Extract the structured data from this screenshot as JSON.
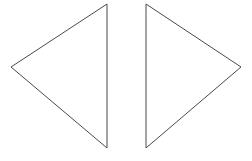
{
  "canvas": {
    "width": 252,
    "height": 161,
    "background_color": "#ffffff",
    "description": "Two outlined triangles facing each other"
  },
  "style": {
    "stroke_color": "#4a4a4a",
    "stroke_width": 1,
    "fill": "none"
  },
  "shapes": [
    {
      "name": "left-triangle",
      "type": "triangle",
      "orientation": "pointing-left",
      "points": "11,67 107,4 107,148",
      "vertices": [
        {
          "label": "apex-left",
          "x": 11,
          "y": 67
        },
        {
          "label": "top-right",
          "x": 107,
          "y": 4
        },
        {
          "label": "bottom-right",
          "x": 107,
          "y": 148
        }
      ]
    },
    {
      "name": "right-triangle",
      "type": "triangle",
      "orientation": "pointing-right",
      "points": "241,67 146,4 146,148",
      "vertices": [
        {
          "label": "apex-right",
          "x": 241,
          "y": 67
        },
        {
          "label": "top-left",
          "x": 146,
          "y": 4
        },
        {
          "label": "bottom-left",
          "x": 146,
          "y": 148
        }
      ]
    }
  ]
}
